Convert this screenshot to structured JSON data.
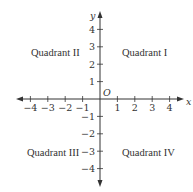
{
  "diagram": {
    "axis_labels": {
      "x": "x",
      "y": "y",
      "origin": "O"
    },
    "x_ticks": [
      "−4",
      "−3",
      "−2",
      "−1",
      "1",
      "2",
      "3",
      "4"
    ],
    "x_values": [
      -4,
      -3,
      -2,
      -1,
      1,
      2,
      3,
      4
    ],
    "y_ticks": [
      "4",
      "3",
      "2",
      "1",
      "−1",
      "−2",
      "−3",
      "−4"
    ],
    "y_values": [
      4,
      3,
      2,
      1,
      -1,
      -2,
      -3,
      -4
    ],
    "quadrants": {
      "q1": "Quadrant I",
      "q2": "Quadrant II",
      "q3": "Quadrant III",
      "q4": "Quadrant IV"
    },
    "colors": {
      "ink": "#333333",
      "background": "#ffffff"
    }
  }
}
